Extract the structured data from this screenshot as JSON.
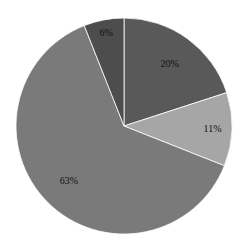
{
  "chart_data": {
    "type": "pie",
    "title": "",
    "categories": [
      "A",
      "B",
      "C",
      "D"
    ],
    "values": [
      20,
      11,
      63,
      6
    ],
    "labels": [
      "20%",
      "11%",
      "63%",
      "6%"
    ],
    "colors": [
      "#595959",
      "#a6a6a6",
      "#7a7a7a",
      "#4d4d4d"
    ],
    "start_angle_deg": 90,
    "direction": "clockwise",
    "legend": "none"
  }
}
